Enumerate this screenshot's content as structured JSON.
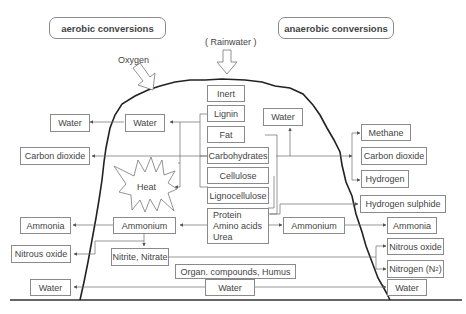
{
  "headers": {
    "aerobic": "aerobic conversions",
    "anaerobic": "anaerobic conversions"
  },
  "inputs": {
    "rainwater": "( Rainwater )",
    "oxygen": "Oxygen"
  },
  "center_column": {
    "inert": "Inert",
    "lignin": "Lignin",
    "fat": "Fat",
    "carbohydrates": "Carbohydrates",
    "cellulose": "Cellulose",
    "lignocellulose": "Lignocellulose",
    "protein_lines": [
      "Protein",
      "Amino acids",
      "Urea"
    ],
    "organic_compounds": "Organ. compounds, Humus",
    "water_bottom": "Water"
  },
  "aerobic_side": {
    "water_inner": "Water",
    "water_outer": "Water",
    "carbon_dioxide": "Carbon dioxide",
    "heat": "Heat",
    "ammonium": "Ammonium",
    "ammonia": "Ammonia",
    "nitrite_nitrate": "Nitrite, Nitrate",
    "nitrous_oxide": "Nitrous oxide",
    "water_bottom": "Water"
  },
  "anaerobic_side": {
    "water_top": "Water",
    "methane": "Methane",
    "carbon_dioxide": "Carbon dioxide",
    "hydrogen": "Hydrogen",
    "hydrogen_sulphide": "Hydrogen sulphide",
    "ammonium": "Ammonium",
    "ammonia": "Ammonia",
    "nitrous_oxide": "Nitrous oxide",
    "nitrogen": "Nitrogen (N",
    "nitrogen_sub": "2",
    "nitrogen_close": ")",
    "water_bottom": "Water"
  },
  "colors": {
    "line": "#6a6a6a",
    "box_border": "#8a8a8a",
    "mound": "#222222",
    "text": "#444444"
  }
}
